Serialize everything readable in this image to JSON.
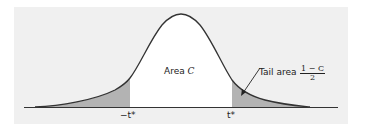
{
  "diagram": {
    "title": "",
    "curve": "t distribution density",
    "center_label_prefix": "Area ",
    "center_label_var": "C",
    "tail_label": "Tail area",
    "tail_fraction_numerator": "1 − C",
    "tail_fraction_denominator": "2",
    "left_critical": "−t*",
    "right_critical": "t*",
    "colors": {
      "panel": "#f0f0f0",
      "curve": "#333333",
      "tail_fill": "#b3b3b3",
      "center_fill": "#ffffff",
      "baseline": "#333333"
    }
  }
}
